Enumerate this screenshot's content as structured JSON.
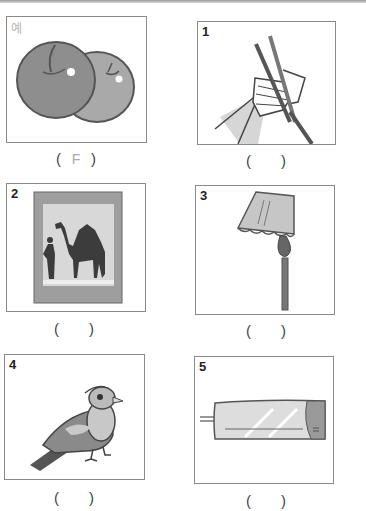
{
  "worksheet": {
    "items": [
      {
        "label": "예",
        "picture": "apples",
        "answer": "F"
      },
      {
        "label": "1",
        "picture": "hand-holding-chopsticks",
        "answer": ""
      },
      {
        "label": "2",
        "picture": "camel-picture-frame",
        "answer": ""
      },
      {
        "label": "3",
        "picture": "floor-lamp",
        "answer": ""
      },
      {
        "label": "4",
        "picture": "bird",
        "answer": ""
      },
      {
        "label": "5",
        "picture": "air-conditioner",
        "answer": ""
      }
    ],
    "paren_open": "(",
    "paren_close": ")"
  }
}
